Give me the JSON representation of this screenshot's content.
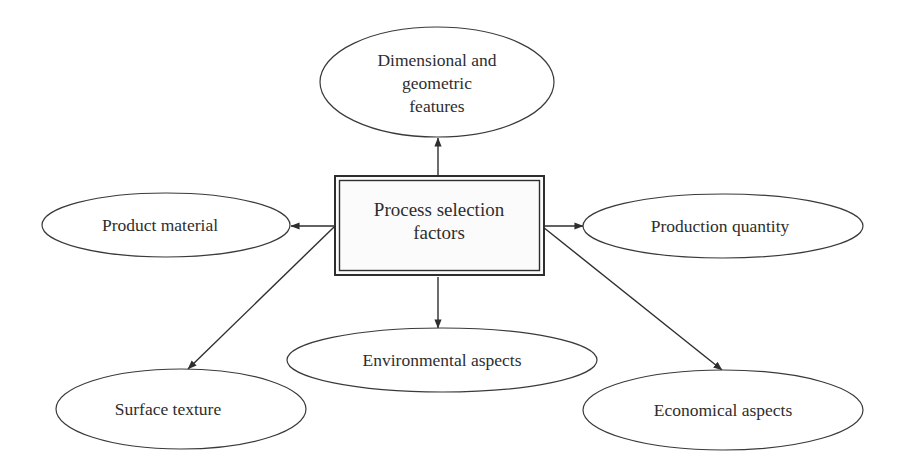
{
  "diagram": {
    "type": "hub-and-spoke",
    "center": {
      "lines": [
        "Process selection",
        "factors"
      ]
    },
    "nodes": [
      {
        "id": "dimensional",
        "lines": [
          "Dimensional and",
          "geometric",
          "features"
        ]
      },
      {
        "id": "product-material",
        "lines": [
          "Product material"
        ]
      },
      {
        "id": "production-quantity",
        "lines": [
          "Production quantity"
        ]
      },
      {
        "id": "environmental",
        "lines": [
          "Environmental aspects"
        ]
      },
      {
        "id": "surface-texture",
        "lines": [
          "Surface texture"
        ]
      },
      {
        "id": "economical",
        "lines": [
          "Economical aspects"
        ]
      }
    ],
    "edges": [
      {
        "from": "center",
        "to": "dimensional"
      },
      {
        "from": "center",
        "to": "product-material"
      },
      {
        "from": "center",
        "to": "production-quantity"
      },
      {
        "from": "center",
        "to": "environmental"
      },
      {
        "from": "center",
        "to": "surface-texture"
      },
      {
        "from": "center",
        "to": "economical"
      }
    ],
    "colors": {
      "stroke": "#2e2e2e",
      "text": "#2e2e2e",
      "background": "#ffffff"
    }
  }
}
